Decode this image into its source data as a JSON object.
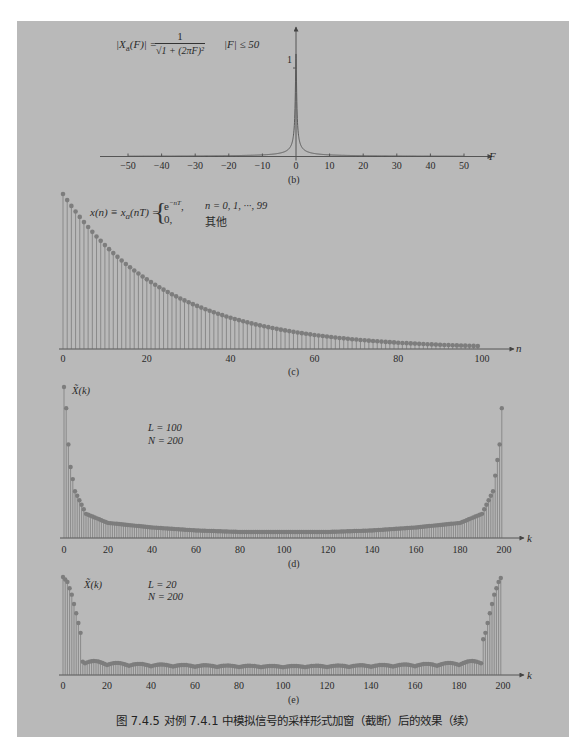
{
  "figure": {
    "caption": "图 7.4.5   对例 7.4.1 中模拟信号的采样形式加窗（截断）后的效果（续）",
    "panel_color": "#b9b9b9",
    "ink_color": "#555555",
    "stem_color": "#6a6a6a",
    "marker_color": "#7d7d7d"
  },
  "plot_b": {
    "sublabel": "(b)",
    "formula_lhs": "|X",
    "formula_sub": "a",
    "formula_mid": "(F)| = ",
    "formula_num": "1",
    "formula_den": "√1 + (2πF)²",
    "formula_cond": "|F| ≤ 50",
    "y_tick_label": "1",
    "x_axis_label": "F",
    "x_ticks": [
      "−50",
      "−40",
      "−30",
      "−20",
      "−10",
      "0",
      "10",
      "20",
      "30",
      "40",
      "50"
    ]
  },
  "plot_c": {
    "sublabel": "(c)",
    "formula_lhs": "x(n) ≡ x",
    "formula_sub": "a",
    "formula_rhs": "(nT) = ",
    "case1_expr": "e",
    "case1_sup": "−nT",
    "case1_cond": "n = 0, 1, ···, 99",
    "case2_expr": "0,",
    "case2_cond": "其他",
    "x_axis_label": "n",
    "x_ticks": [
      "0",
      "20",
      "40",
      "60",
      "80",
      "100"
    ]
  },
  "plot_d": {
    "sublabel": "(d)",
    "y_label": "X̃(k)",
    "param_L": "L = 100",
    "param_N": "N = 200",
    "x_axis_label": "k",
    "x_ticks": [
      "0",
      "20",
      "40",
      "60",
      "80",
      "100",
      "120",
      "140",
      "160",
      "180",
      "200"
    ]
  },
  "plot_e": {
    "sublabel": "(e)",
    "y_label": "X̃(k)",
    "param_L": "L = 20",
    "param_N": "N = 200",
    "x_axis_label": "k",
    "x_ticks": [
      "0",
      "20",
      "40",
      "60",
      "80",
      "100",
      "120",
      "140",
      "160",
      "180",
      "200"
    ]
  },
  "chart_data": [
    {
      "id": "b",
      "type": "line",
      "title": "|Xa(F)| = 1/sqrt(1+(2πF)^2), |F| ≤ 50",
      "xlabel": "F",
      "ylabel": "|Xa(F)|",
      "xlim": [
        -50,
        50
      ],
      "ylim": [
        0,
        1
      ],
      "x": [
        -50,
        -40,
        -30,
        -20,
        -10,
        -5,
        -2,
        -1,
        -0.5,
        -0.2,
        -0.1,
        0,
        0.1,
        0.2,
        0.5,
        1,
        2,
        5,
        10,
        20,
        30,
        40,
        50
      ],
      "values": [
        0.003,
        0.004,
        0.005,
        0.008,
        0.016,
        0.032,
        0.079,
        0.157,
        0.303,
        0.623,
        0.847,
        1.0,
        0.847,
        0.623,
        0.303,
        0.157,
        0.079,
        0.032,
        0.016,
        0.008,
        0.005,
        0.004,
        0.003
      ],
      "grid": false
    },
    {
      "id": "c",
      "type": "stem",
      "title": "x(n) = e^{-nT}, n = 0..99; 0 otherwise",
      "xlabel": "n",
      "xlim": [
        0,
        100
      ],
      "ylim": [
        0,
        1
      ],
      "params": {
        "T": 0.04,
        "length": 100
      },
      "x_sampled": [
        0,
        10,
        20,
        30,
        40,
        50,
        60,
        70,
        80,
        90,
        99
      ],
      "values_sampled": [
        1.0,
        0.67,
        0.449,
        0.301,
        0.202,
        0.135,
        0.091,
        0.061,
        0.041,
        0.027,
        0.019
      ],
      "grid": false
    },
    {
      "id": "d",
      "type": "stem",
      "title": "|X̃(k)|, L = 100, N = 200",
      "xlabel": "k",
      "xlim": [
        0,
        200
      ],
      "ylim": [
        0,
        1
      ],
      "params": {
        "L": 100,
        "N": 200,
        "T": 0.04
      },
      "x_sampled": [
        0,
        1,
        2,
        3,
        5,
        10,
        20,
        40,
        60,
        80,
        100,
        120,
        140,
        160,
        180,
        190,
        195,
        198,
        199
      ],
      "values_sampled": [
        1.0,
        0.86,
        0.62,
        0.47,
        0.31,
        0.16,
        0.1,
        0.07,
        0.05,
        0.04,
        0.04,
        0.04,
        0.05,
        0.07,
        0.1,
        0.16,
        0.31,
        0.62,
        0.86
      ],
      "grid": false
    },
    {
      "id": "e",
      "type": "stem",
      "title": "|X̃(k)|, L = 20, N = 200",
      "xlabel": "k",
      "xlim": [
        0,
        200
      ],
      "ylim": [
        0,
        1
      ],
      "params": {
        "L": 20,
        "N": 200,
        "T": 0.04
      },
      "x_sampled": [
        0,
        2,
        4,
        6,
        8,
        10,
        13,
        20,
        25,
        30,
        40,
        50,
        60,
        100,
        140,
        150,
        160,
        170,
        175,
        180,
        187,
        190,
        192,
        194,
        196,
        198,
        199
      ],
      "values_sampled": [
        1.0,
        0.95,
        0.82,
        0.63,
        0.43,
        0.3,
        0.34,
        0.17,
        0.21,
        0.12,
        0.11,
        0.1,
        0.09,
        0.07,
        0.09,
        0.11,
        0.11,
        0.12,
        0.21,
        0.17,
        0.34,
        0.3,
        0.43,
        0.63,
        0.82,
        0.95,
        0.99
      ],
      "grid": false
    }
  ]
}
